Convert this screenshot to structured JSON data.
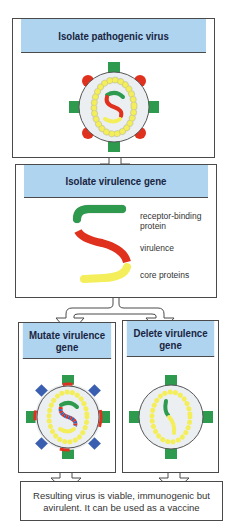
{
  "colors": {
    "header_bg": "#aed4f0",
    "border": "#4a4a4a",
    "green": "#2e9a4e",
    "red": "#e0301e",
    "yellow": "#f3ee5a",
    "envelope": "#eceff2",
    "blue": "#3a5fb0"
  },
  "steps": {
    "isolate_virus": {
      "title": "Isolate pathogenic virus"
    },
    "isolate_gene": {
      "title": "Isolate virulence gene",
      "labels": {
        "receptor_line1": "receptor-binding",
        "receptor_line2": "protein",
        "virulence": "virulence",
        "core": "core proteins"
      }
    },
    "mutate": {
      "title_line1": "Mutate virulence",
      "title_line2": "gene"
    },
    "delete": {
      "title_line1": "Delete virulence",
      "title_line2": "gene"
    },
    "result": {
      "line1": "Resulting virus is viable, immunogenic but",
      "line2": "avirulent. It can be used as a vaccine"
    }
  }
}
